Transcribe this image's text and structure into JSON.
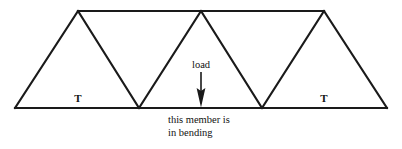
{
  "figure": {
    "type": "truss-diagram",
    "width": 402,
    "height": 149,
    "background_color": "#ffffff",
    "line_color": "#1a1a1a",
    "line_width": 2
  },
  "labels": {
    "tension_left": "T",
    "tension_right": "T",
    "load": "load",
    "caption_line1": "this member is",
    "caption_line2": "in bending"
  },
  "geometry": {
    "bottom_chord_y": 108,
    "top_chord_y": 11,
    "bottom_left_x": 15,
    "bottom_right_x": 387,
    "apex_x": [
      78,
      201,
      324
    ],
    "bottom_node_x": [
      139,
      262
    ],
    "load_arrow": {
      "x": 201,
      "y_start": 72,
      "y_end": 107
    }
  }
}
